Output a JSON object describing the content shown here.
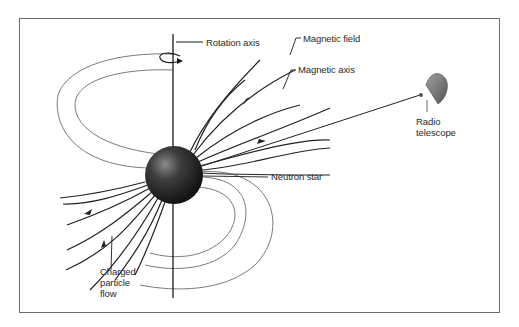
{
  "diagram": {
    "labels": {
      "rotation_axis": "Rotation axis",
      "magnetic_field": "Magnetic field",
      "magnetic_axis": "Magnetic axis",
      "radio_telescope": "Radio\ntelescope",
      "neutron_star": "Neutron star",
      "charged_particle_flow": "Charged\nparticle\nflow"
    },
    "colors": {
      "frame": "#6a6a6a",
      "field_lines": "#2a2a2a",
      "closed_loops": "#7a7a7a",
      "star_dark": "#111111",
      "star_highlight": "#8a8a8a",
      "telescope": "#7d7d7d"
    }
  }
}
